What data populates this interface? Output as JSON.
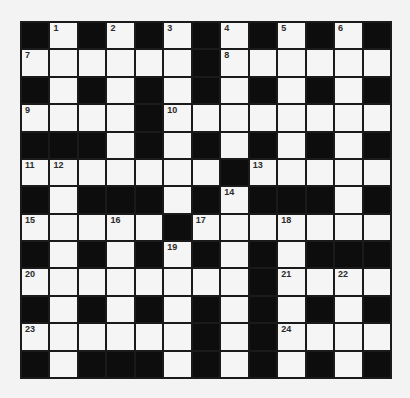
{
  "puzzle": {
    "type": "crossword",
    "rows": 13,
    "cols": 13,
    "colors": {
      "block": "#0d0d0d",
      "open": "#f5f5f5",
      "grid_line": "#1a1a1a",
      "background": "#f3f3f3"
    },
    "legend": "# = black block, . = open cell",
    "grid": [
      "#.#.#.#.#.#.#",
      "......#......",
      "#.#.#.#.#.#.#",
      "....#........",
      "###.#.#.#.#.#",
      ".......#.....",
      "#.###.#.###.#",
      ".....#.......",
      "#.#.#.#.#.###",
      "........#....",
      "#.#.#.#.#.#.#",
      "......#.#....",
      "#.###.#.#.#.#"
    ],
    "numbers": [
      {
        "row": 0,
        "col": 1,
        "n": "1"
      },
      {
        "row": 0,
        "col": 3,
        "n": "2"
      },
      {
        "row": 0,
        "col": 5,
        "n": "3"
      },
      {
        "row": 0,
        "col": 7,
        "n": "4"
      },
      {
        "row": 0,
        "col": 9,
        "n": "5"
      },
      {
        "row": 0,
        "col": 11,
        "n": "6"
      },
      {
        "row": 1,
        "col": 0,
        "n": "7"
      },
      {
        "row": 1,
        "col": 7,
        "n": "8"
      },
      {
        "row": 3,
        "col": 0,
        "n": "9"
      },
      {
        "row": 3,
        "col": 5,
        "n": "10"
      },
      {
        "row": 5,
        "col": 0,
        "n": "11"
      },
      {
        "row": 5,
        "col": 1,
        "n": "12"
      },
      {
        "row": 5,
        "col": 8,
        "n": "13"
      },
      {
        "row": 6,
        "col": 7,
        "n": "14"
      },
      {
        "row": 7,
        "col": 0,
        "n": "15"
      },
      {
        "row": 7,
        "col": 3,
        "n": "16"
      },
      {
        "row": 7,
        "col": 6,
        "n": "17"
      },
      {
        "row": 7,
        "col": 9,
        "n": "18"
      },
      {
        "row": 8,
        "col": 5,
        "n": "19"
      },
      {
        "row": 9,
        "col": 0,
        "n": "20"
      },
      {
        "row": 9,
        "col": 9,
        "n": "21"
      },
      {
        "row": 9,
        "col": 11,
        "n": "22"
      },
      {
        "row": 11,
        "col": 0,
        "n": "23"
      },
      {
        "row": 11,
        "col": 9,
        "n": "24"
      }
    ],
    "entries": []
  }
}
